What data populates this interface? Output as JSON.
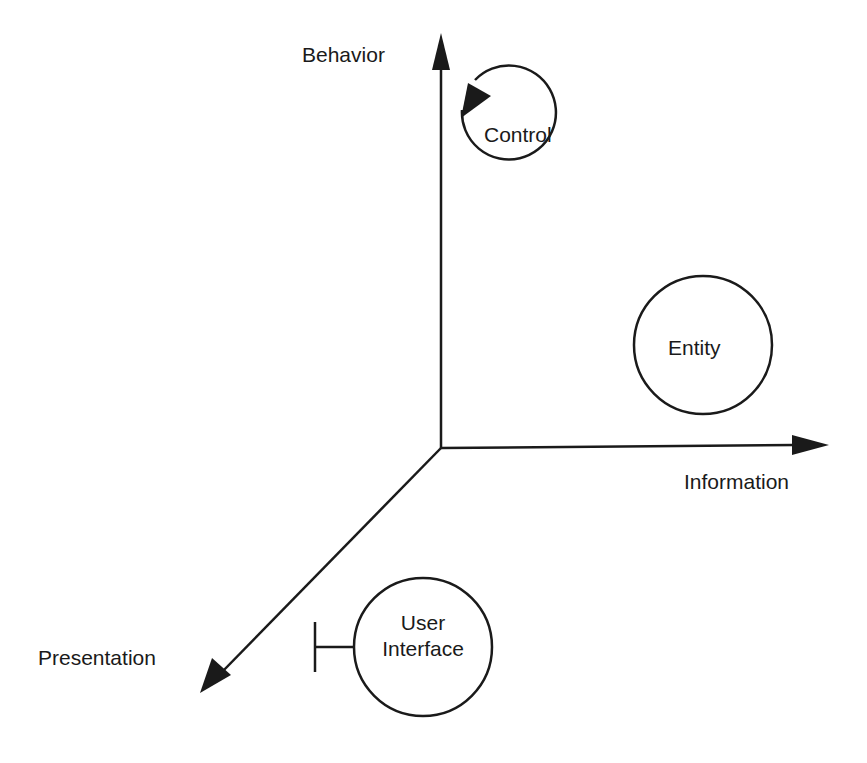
{
  "diagram": {
    "axes": {
      "behavior": "Behavior",
      "information": "Information",
      "presentation": "Presentation"
    },
    "objects": {
      "control": "Control",
      "entity": "Entity",
      "ui_line1": "User",
      "ui_line2": "Interface"
    },
    "colors": {
      "stroke": "#1a1a1a",
      "background": "#ffffff"
    }
  }
}
